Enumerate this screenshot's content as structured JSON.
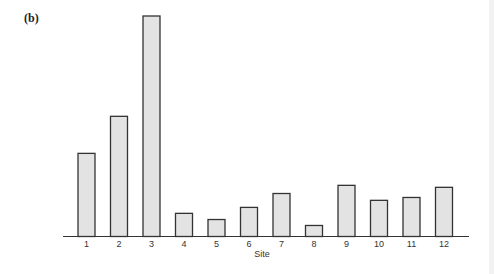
{
  "chart_data": {
    "type": "bar",
    "panel_label": "(b)",
    "title": "",
    "xlabel": "Site",
    "ylabel": "",
    "categories": [
      "1",
      "2",
      "3",
      "4",
      "5",
      "6",
      "7",
      "8",
      "9",
      "10",
      "11",
      "12"
    ],
    "values": [
      37.7,
      54.5,
      100,
      10.5,
      7.7,
      13.2,
      19.5,
      5.0,
      23.2,
      16.4,
      17.7,
      22.3
    ],
    "value_units": "relative height (tallest bar = 100); no y-axis shown",
    "ylim": [
      0,
      100
    ],
    "grid": false,
    "legend": "none",
    "colors": {
      "bar_fill": "#e3e3e3",
      "bar_stroke": "#333333",
      "axis": "#333333"
    }
  }
}
